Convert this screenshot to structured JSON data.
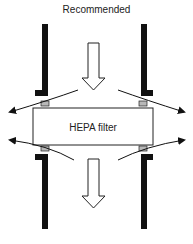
{
  "title": "Recommended",
  "filter": {
    "label": "HEPA filter"
  },
  "colors": {
    "wall": "#111111",
    "gasket": "#b8b8b8",
    "outline": "#222222"
  },
  "elements": {
    "airflow_arrows": [
      "inflow-down-arrow",
      "outflow-down-arrow"
    ],
    "leak_arrows": [
      "top-left",
      "top-right",
      "bottom-left",
      "bottom-right"
    ],
    "gaskets": 4,
    "walls": 4
  }
}
